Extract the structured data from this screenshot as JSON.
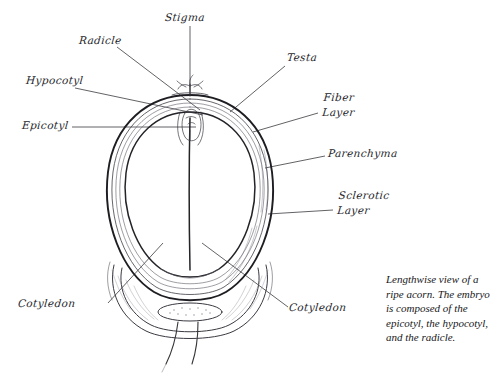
{
  "figure": {
    "title": "Lengthwise view of a ripe acorn",
    "medium": "pen-and-ink botanical illustration",
    "ink_color": "#2b2b30",
    "background_color": "#ffffff"
  },
  "labels": {
    "stigma": "Stigma",
    "radicle": "Radicle",
    "hypocotyl": "Hypocotyl",
    "epicotyl": "Epicotyl",
    "testa": "Testa",
    "fiber_layer": "Fiber\nLayer",
    "parenchyma": "Parenchyma",
    "sclerotic_layer": "Sclerotic\nLayer",
    "cotyledon_left": "Cotyledon",
    "cotyledon_right": "Cotyledon"
  },
  "caption": {
    "text": "Lengthwise view of a ripe acorn. The embryo is composed of the epicotyl, the hypocotyl, and the radicle."
  }
}
